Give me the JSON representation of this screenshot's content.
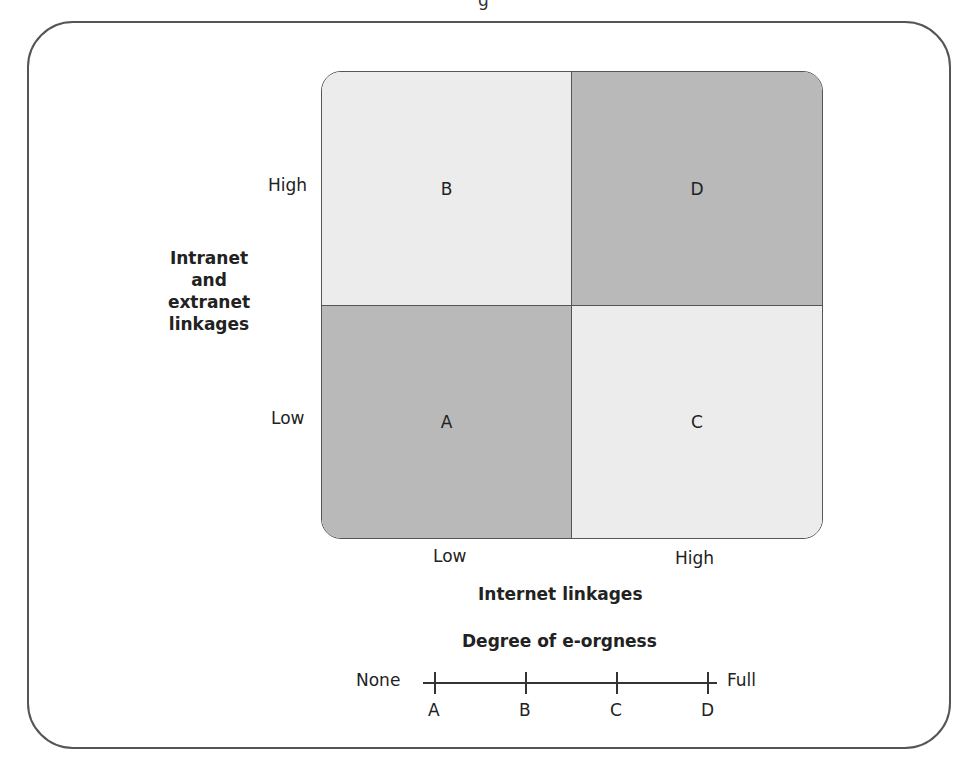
{
  "figure": {
    "title_fragment": "g",
    "y_axis": {
      "title": [
        "Intranet",
        "and",
        "extranet",
        "linkages"
      ],
      "ticks": [
        "High",
        "Low"
      ]
    },
    "x_axis": {
      "title": "Internet linkages",
      "ticks": [
        "Low",
        "High"
      ]
    },
    "quadrants": [
      {
        "id": "B",
        "label": "B",
        "position": "top-left",
        "x": "Low",
        "y": "High",
        "shade": "light",
        "color": "#ececec"
      },
      {
        "id": "D",
        "label": "D",
        "position": "top-right",
        "x": "High",
        "y": "High",
        "shade": "dark",
        "color": "#b9b9b9"
      },
      {
        "id": "A",
        "label": "A",
        "position": "bottom-left",
        "x": "Low",
        "y": "Low",
        "shade": "dark",
        "color": "#b9b9b9"
      },
      {
        "id": "C",
        "label": "C",
        "position": "bottom-right",
        "x": "High",
        "y": "Low",
        "shade": "light",
        "color": "#ececec"
      }
    ],
    "scale": {
      "title": "Degree of e-orgness",
      "left_label": "None",
      "right_label": "Full",
      "points": [
        "A",
        "B",
        "C",
        "D"
      ]
    }
  }
}
